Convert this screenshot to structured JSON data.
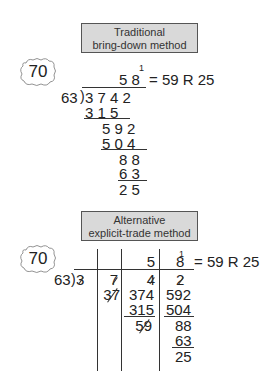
{
  "figure1": {
    "title_line1": "Traditional",
    "title_line2": "bring-down method",
    "estimate": "70",
    "divisor": "63",
    "dividend": "3 7 4 2",
    "quotient": "5 8",
    "carry": "1",
    "result": "= 59 R 25",
    "steps": [
      {
        "value": "3 1 5",
        "underline": true
      },
      {
        "value": "5 9 2",
        "underline": false
      },
      {
        "value": "5 0 4",
        "underline": true
      },
      {
        "value": "8 8",
        "underline": false
      },
      {
        "value": "6 3",
        "underline": true
      },
      {
        "value": "2 5",
        "underline": false
      }
    ]
  },
  "figure2": {
    "title_line1": "Alternative",
    "title_line2": "explicit-trade method",
    "estimate": "70",
    "divisor": "63",
    "quotient_col3": "5",
    "quotient_col4": "8",
    "carry": "1",
    "result": "= 59 R 25",
    "col1": {
      "digit": "3",
      "struck": true
    },
    "col2": {
      "digit": "7",
      "struck": true,
      "traded": "37",
      "traded_struck": true
    },
    "col3": {
      "digit": "4",
      "struck": true,
      "rows": [
        "374",
        "315",
        "59"
      ]
    },
    "col4": {
      "digit": "2",
      "struck": true,
      "rows": [
        "592",
        "504",
        "88",
        "63",
        "25"
      ]
    }
  }
}
